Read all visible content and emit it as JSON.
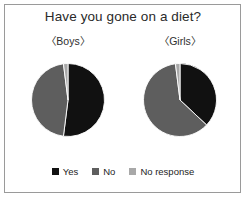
{
  "figure": {
    "title": "Have you gone on a diet?",
    "background": "#ffffff",
    "border_color": "#9a9a9a"
  },
  "panels": [
    {
      "label": "〈Boys〉"
    },
    {
      "label": "〈Girls〉"
    }
  ],
  "legend": {
    "items": [
      {
        "label": "Yes",
        "color": "#111111",
        "swatch_icon": "square-swatch-icon"
      },
      {
        "label": "No",
        "color": "#5e5e5e",
        "swatch_icon": "square-swatch-icon"
      },
      {
        "label": "No response",
        "color": "#a8a8a8",
        "swatch_icon": "square-swatch-icon"
      }
    ]
  },
  "chart_data": {
    "type": "pie",
    "title": "Have you gone on a diet?",
    "categories": [
      "Yes",
      "No",
      "No response"
    ],
    "colors": [
      "#111111",
      "#5e5e5e",
      "#a8a8a8"
    ],
    "legend_position": "bottom",
    "start_angle_deg": 0,
    "direction": "clockwise",
    "units": "percent",
    "charts": [
      {
        "name": "〈Boys〉",
        "values": [
          52,
          46,
          2
        ],
        "slices": [
          {
            "label": "Yes",
            "value": 52,
            "color": "#111111"
          },
          {
            "label": "No",
            "value": 46,
            "color": "#5e5e5e"
          },
          {
            "label": "No response",
            "value": 2,
            "color": "#a8a8a8"
          }
        ]
      },
      {
        "name": "〈Girls〉",
        "values": [
          37,
          61,
          2
        ],
        "slices": [
          {
            "label": "Yes",
            "value": 37,
            "color": "#111111"
          },
          {
            "label": "No",
            "value": 61,
            "color": "#5e5e5e"
          },
          {
            "label": "No response",
            "value": 2,
            "color": "#a8a8a8"
          }
        ]
      }
    ]
  }
}
